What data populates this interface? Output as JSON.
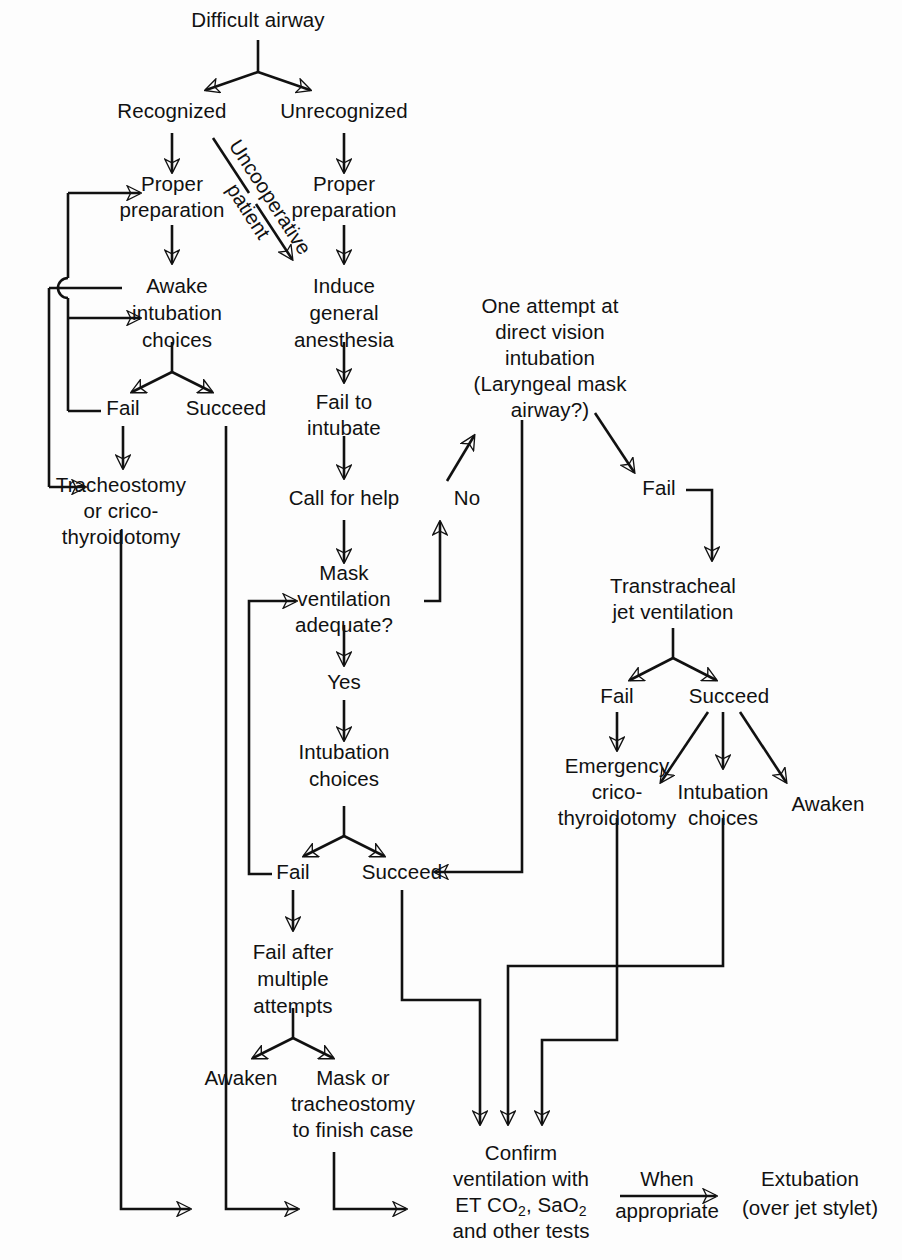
{
  "diagram": {
    "type": "flowchart",
    "background_color": "#fdfdfd",
    "line_color": "#111111",
    "text_color": "#111111"
  },
  "nodes": {
    "difficult_airway": "Difficult airway",
    "recognized": "Recognized",
    "unrecognized": "Unrecognized",
    "proper_prep_left": {
      "l1": "Proper",
      "l2": "preparation"
    },
    "proper_prep_right": {
      "l1": "Proper",
      "l2": "preparation"
    },
    "awake_intubation": {
      "l1": "Awake",
      "l2": "intubation",
      "l3": "choices"
    },
    "induce_general": {
      "l1": "Induce",
      "l2": "general",
      "l3": "anesthesia"
    },
    "fail_awake": "Fail",
    "succeed_awake": "Succeed",
    "tracheostomy": {
      "l1": "Tracheostomy",
      "l2": "or crico-",
      "l3": "thyroidotomy"
    },
    "fail_to_intubate": {
      "l1": "Fail to",
      "l2": "intubate"
    },
    "call_for_help": "Call for help",
    "mask_ventilation": {
      "l1": "Mask",
      "l2": "ventilation",
      "l3": "adequate?"
    },
    "yes": "Yes",
    "no": "No",
    "intubation_choices_mid": {
      "l1": "Intubation",
      "l2": "choices"
    },
    "fail_mid": "Fail",
    "succeed_mid": "Succeed",
    "fail_after_multiple": {
      "l1": "Fail after",
      "l2": "multiple",
      "l3": "attempts"
    },
    "awaken_mid": "Awaken",
    "mask_or_tracheostomy": {
      "l1": "Mask or",
      "l2": "tracheostomy",
      "l3": "to finish case"
    },
    "one_attempt": {
      "l1": "One attempt at",
      "l2": "direct vision",
      "l3": "intubation",
      "l4": "(Laryngeal mask",
      "l5": "airway?)"
    },
    "fail_one_attempt": "Fail",
    "transtracheal": {
      "l1": "Transtracheal",
      "l2": "jet ventilation"
    },
    "fail_jet": "Fail",
    "succeed_jet": "Succeed",
    "emergency_crico": {
      "l1": "Emergency",
      "l2": "crico-",
      "l3": "thyroidotomy"
    },
    "intubation_choices_right": {
      "l1": "Intubation",
      "l2": "choices"
    },
    "awaken_right": "Awaken",
    "confirm_ventilation": {
      "l1": "Confirm",
      "l2": "ventilation with",
      "l3_a": "ET CO",
      "l3_sub1": "2",
      "l3_b": ", SaO",
      "l3_sub2": "2",
      "l4": "and other tests"
    },
    "extubation": {
      "l1": "Extubation",
      "l2": "(over jet stylet)"
    }
  },
  "edge_labels": {
    "uncooperative": {
      "l1": "Uncooperative",
      "l2": "patient"
    },
    "when_appropriate": {
      "l1": "When",
      "l2": "appropriate"
    }
  }
}
